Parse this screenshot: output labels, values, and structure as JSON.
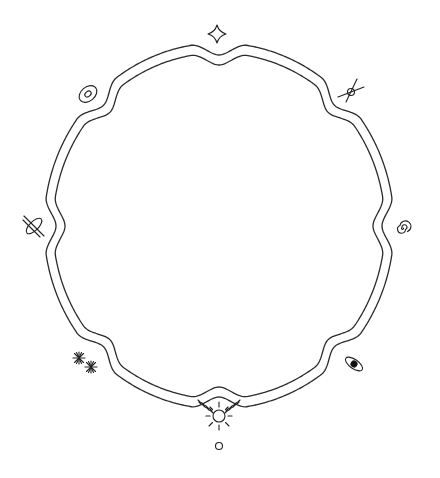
{
  "board": {
    "title": "",
    "ring_color": "#2b2b2b",
    "glyph_color": "#222222",
    "background": "#ffffff",
    "nodes": [
      {
        "id": "north",
        "icon": "four-point-star-icon",
        "angle_deg": -90
      },
      {
        "id": "northeast",
        "icon": "crossed-lines-circle-icon",
        "angle_deg": -45
      },
      {
        "id": "east",
        "icon": "spiral-icon",
        "angle_deg": 0
      },
      {
        "id": "southeast",
        "icon": "eye-ellipse-icon",
        "angle_deg": 45
      },
      {
        "id": "south",
        "icon": "sun-chain-icon",
        "angle_deg": 90
      },
      {
        "id": "southwest",
        "icon": "twin-asterisk-icon",
        "angle_deg": 135
      },
      {
        "id": "west",
        "icon": "orbit-cross-icon",
        "angle_deg": 180
      },
      {
        "id": "northwest",
        "icon": "oval-eye-icon",
        "angle_deg": 225
      }
    ],
    "bottom_marker": {
      "icon": "small-circle-icon"
    }
  }
}
